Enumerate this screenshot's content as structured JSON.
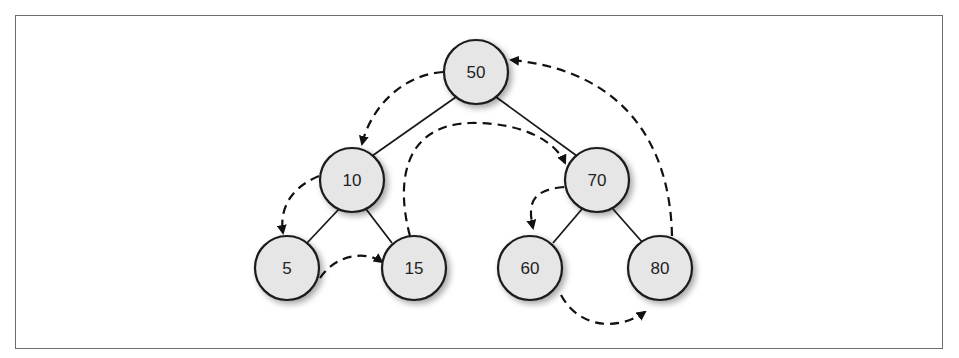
{
  "diagram": {
    "type": "binary-search-tree-traversal",
    "nodes": [
      {
        "id": "n50",
        "label": "50",
        "x": 476,
        "y": 72
      },
      {
        "id": "n10",
        "label": "10",
        "x": 352,
        "y": 180
      },
      {
        "id": "n70",
        "label": "70",
        "x": 597,
        "y": 180
      },
      {
        "id": "n5",
        "label": "5",
        "x": 287,
        "y": 268
      },
      {
        "id": "n15",
        "label": "15",
        "x": 414,
        "y": 268
      },
      {
        "id": "n60",
        "label": "60",
        "x": 530,
        "y": 268
      },
      {
        "id": "n80",
        "label": "80",
        "x": 660,
        "y": 268
      }
    ],
    "edges": [
      {
        "from": "50",
        "to": "10"
      },
      {
        "from": "50",
        "to": "70"
      },
      {
        "from": "10",
        "to": "5"
      },
      {
        "from": "10",
        "to": "15"
      },
      {
        "from": "70",
        "to": "60"
      },
      {
        "from": "70",
        "to": "80"
      }
    ],
    "traversal_arrows": [
      {
        "from": "50",
        "to": "10"
      },
      {
        "from": "10",
        "to": "5"
      },
      {
        "from": "5",
        "to": "15"
      },
      {
        "from": "15",
        "to": "70"
      },
      {
        "from": "70",
        "to": "60"
      },
      {
        "from": "60",
        "to": "80"
      },
      {
        "from": "80",
        "to": "50"
      }
    ],
    "colors": {
      "node_fill": "#e6e6e6",
      "stroke": "#1a1a1a",
      "frame": "#6e6e6e"
    }
  }
}
